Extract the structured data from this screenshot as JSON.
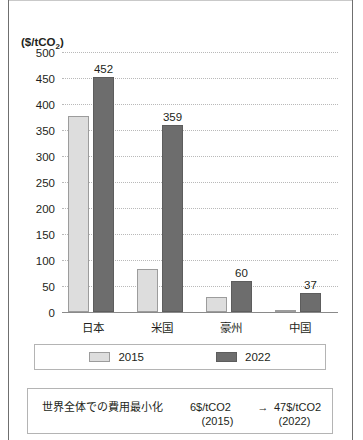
{
  "top_caption": "",
  "chart_data": {
    "type": "bar",
    "title": "",
    "subtitle": "",
    "xlabel": "",
    "ylabel": "($/tCO2)",
    "ylabel_display": "($/tCO",
    "ylabel_sub": "2",
    "ylabel_tail": ")",
    "ylim": [
      0,
      500
    ],
    "ytick_step": 50,
    "grid": true,
    "legend_position": "bottom",
    "categories": [
      "日本",
      "米国",
      "豪州",
      "中国"
    ],
    "yticks": [
      "500",
      "450",
      "400",
      "350",
      "300",
      "250",
      "200",
      "150",
      "100",
      "50",
      "0"
    ],
    "ytick_values": [
      500,
      450,
      400,
      350,
      300,
      250,
      200,
      150,
      100,
      50,
      0
    ],
    "series": [
      {
        "name": "2015",
        "color": "#dddddd",
        "values": [
          377,
          82,
          29,
          2
        ],
        "data_labels": [
          "",
          "",
          "",
          ""
        ]
      },
      {
        "name": "2022",
        "color": "#6d6d6d",
        "values": [
          452,
          359,
          60,
          37
        ],
        "data_labels": [
          "452",
          "359",
          "60",
          "37"
        ]
      }
    ]
  },
  "legend": {
    "items": [
      {
        "label": "2015",
        "color": "#dddddd"
      },
      {
        "label": "2022",
        "color": "#6d6d6d"
      }
    ]
  },
  "note": {
    "title": "世界全体での費用最小化",
    "from_value": "6$/tCO2",
    "arrow": "→",
    "to_value": "47$/tCO2",
    "from_year": "(2015)",
    "to_year": "(2022)"
  }
}
